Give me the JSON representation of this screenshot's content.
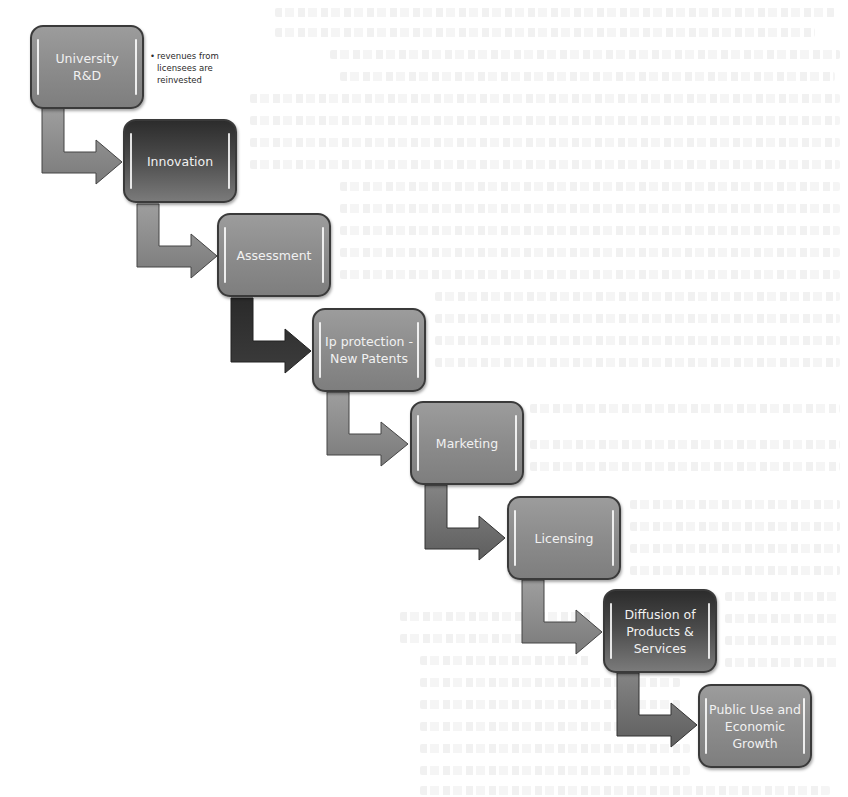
{
  "diagram": {
    "title": "",
    "steps": [
      {
        "label": "University\nR&D",
        "style": "light"
      },
      {
        "label": "Innovation",
        "style": "dark"
      },
      {
        "label": "Assessment",
        "style": "light"
      },
      {
        "label": "Ip protection -\nNew Patents",
        "style": "light"
      },
      {
        "label": "Marketing",
        "style": "light"
      },
      {
        "label": "Licensing",
        "style": "light"
      },
      {
        "label": "Diffusion of\nProducts &\nServices",
        "style": "dark"
      },
      {
        "label": "Public Use and\nEconomic\nGrowth",
        "style": "light"
      }
    ],
    "note": {
      "bullet": "•",
      "line1": "revenues from",
      "line2": "licensees are",
      "line3": "reinvested"
    },
    "arrows": [
      {
        "from": 0,
        "to": 1,
        "shade": "light"
      },
      {
        "from": 1,
        "to": 2,
        "shade": "light"
      },
      {
        "from": 2,
        "to": 3,
        "shade": "dark"
      },
      {
        "from": 3,
        "to": 4,
        "shade": "light"
      },
      {
        "from": 4,
        "to": 5,
        "shade": "medium"
      },
      {
        "from": 5,
        "to": 6,
        "shade": "light"
      },
      {
        "from": 6,
        "to": 7,
        "shade": "dark"
      }
    ],
    "colors": {
      "box_light": "#8c8c8c",
      "box_dark": "#3c3c3c",
      "border": "#3a3a3a",
      "text": "#f1f1f1",
      "arrow_light": "#8a8a8a",
      "arrow_medium": "#6e6e6e",
      "arrow_dark": "#333333"
    }
  }
}
